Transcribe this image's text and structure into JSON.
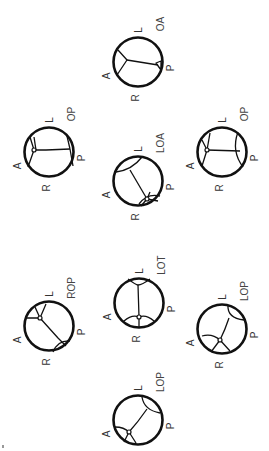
{
  "colors": {
    "stroke": "#111111",
    "label": "#333333",
    "background": "#ffffff"
  },
  "orientation_labels": {
    "anterior": "A",
    "posterior": "P",
    "left": "L",
    "right": "R"
  },
  "diagrams": [
    {
      "name": "OA",
      "cx": 138,
      "cy": 62,
      "labels": {
        "position": "OA",
        "left": "L",
        "anterior": "A",
        "posterior": "P",
        "right": "R"
      },
      "paths": [
        "M118 50 L127 60 L117 75",
        "M127 60 L158 65",
        "M156 63 L161 61 L161 70 Z"
      ]
    },
    {
      "name": "OP",
      "cx": 49,
      "cy": 152,
      "labels": {
        "position": "OP",
        "left": "L",
        "anterior": "A",
        "posterior": "P",
        "right": "R"
      },
      "paths": [
        "M30 137 L34 150 L28 167",
        "M34 150 L46 150 L70 149",
        "M70 149 L67 136 M70 149 L73 166",
        "M34 137 L36 150"
      ],
      "dots": [
        [
          34,
          150
        ]
      ]
    },
    {
      "name": "OP",
      "cx": 222,
      "cy": 152,
      "labels": {
        "position": "OP",
        "left": "L",
        "anterior": "A",
        "posterior": "P",
        "right": "R"
      },
      "paths": [
        "M202 140 L207 150 L202 166",
        "M207 150 L240 151",
        "M238 132 Q231 151 243 167",
        "M210 133 L207 150"
      ],
      "dots": [
        [
          207,
          150
        ]
      ]
    },
    {
      "name": "LOA",
      "cx": 138,
      "cy": 181,
      "labels": {
        "position": "LOA",
        "left": "L",
        "anterior": "A",
        "posterior": "P",
        "right": "R"
      },
      "paths": [
        "M116 172 Q132 170 142 157",
        "M130 170 L147 199",
        "M147 199 L141 206 M147 199 L158 201 M147 199 L150 192",
        "M139 204 Q147 193 160 196"
      ],
      "dots": [
        [
          147,
          199
        ]
      ]
    },
    {
      "name": "ROP",
      "cx": 49,
      "cy": 326,
      "labels": {
        "position": "ROP",
        "left": "L",
        "anterior": "A",
        "posterior": "P",
        "right": "R"
      },
      "paths": [
        "M27 318 L40 318 L46 304",
        "M35 307 L40 318",
        "M40 318 L58 338 L66 346",
        "M53 352 Q58 340 70 341"
      ],
      "dots": [
        [
          40,
          318
        ]
      ]
    },
    {
      "name": "LOT",
      "cx": 139,
      "cy": 303,
      "labels": {
        "position": "LOT",
        "left": "L",
        "anterior": "A",
        "posterior": "P",
        "right": "R"
      },
      "paths": [
        "M128 279 Q136 285 138 285 Q142 285 150 279",
        "M138 285 L139 317",
        "M124 321 Q132 314 139 317 Q146 314 154 321",
        "M139 317 L139 327"
      ],
      "dots": [
        [
          139,
          317
        ]
      ]
    },
    {
      "name": "LOP",
      "cx": 222,
      "cy": 329,
      "labels": {
        "position": "LOP",
        "left": "L",
        "anterior": "A",
        "posterior": "P",
        "right": "R"
      },
      "paths": [
        "M228 305 Q227 318 244 320",
        "M229 318 Q225 330 220 340",
        "M202 336 Q212 333 220 340 L230 351",
        "M220 340 L211 352"
      ],
      "dots": [
        [
          220,
          340
        ]
      ]
    },
    {
      "name": "LOP",
      "cx": 138,
      "cy": 420,
      "labels": {
        "position": "LOP",
        "left": "L",
        "anterior": "A",
        "posterior": "P",
        "right": "R"
      },
      "paths": [
        "M142 397 Q144 410 160 413",
        "M147 409 Q138 422 129 432",
        "M115 427 Q124 427 129 432 L136 443",
        "M129 432 L124 442"
      ],
      "dots": [
        [
          129,
          432
        ]
      ]
    }
  ]
}
